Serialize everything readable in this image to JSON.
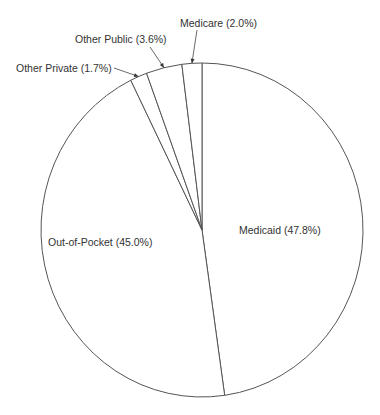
{
  "chart_data": {
    "type": "pie",
    "title": "",
    "start_angle_deg": 0,
    "direction": "clockwise",
    "slices": [
      {
        "label": "Medicaid",
        "value": 47.8,
        "display": "Medicaid (47.8%)"
      },
      {
        "label": "Out-of-Pocket",
        "value": 45.0,
        "display": "Out-of-Pocket (45.0%)"
      },
      {
        "label": "Other Private",
        "value": 1.7,
        "display": "Other Private (1.7%)"
      },
      {
        "label": "Other Public",
        "value": 3.6,
        "display": "Other Public (3.6%)"
      },
      {
        "label": "Medicare",
        "value": 2.0,
        "display": "Medicare (2.0%)"
      }
    ],
    "legend": "none",
    "fill_color": "#ffffff",
    "stroke_color": "#555555"
  }
}
